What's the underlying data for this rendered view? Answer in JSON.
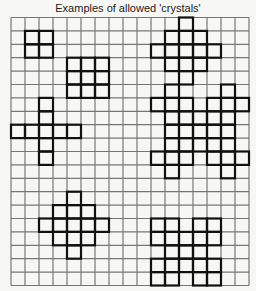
{
  "title": "Examples of allowed  'crystals'",
  "grid": {
    "columns": 17,
    "rows": 20,
    "line_color": "#777777",
    "crystal_color": "#111111"
  },
  "crystals": [
    {
      "name": "square-2x2",
      "cells": [
        [
          1,
          1
        ],
        [
          1,
          2
        ],
        [
          2,
          1
        ],
        [
          2,
          2
        ]
      ]
    },
    {
      "name": "diamond-top-right",
      "cells": [
        [
          0,
          12
        ],
        [
          1,
          11
        ],
        [
          1,
          12
        ],
        [
          1,
          13
        ],
        [
          2,
          10
        ],
        [
          2,
          11
        ],
        [
          2,
          12
        ],
        [
          2,
          13
        ],
        [
          2,
          14
        ],
        [
          3,
          11
        ],
        [
          3,
          12
        ],
        [
          3,
          13
        ],
        [
          4,
          12
        ]
      ]
    },
    {
      "name": "square-3x3",
      "cells": [
        [
          3,
          4
        ],
        [
          3,
          5
        ],
        [
          3,
          6
        ],
        [
          4,
          4
        ],
        [
          4,
          5
        ],
        [
          4,
          6
        ],
        [
          5,
          4
        ],
        [
          5,
          5
        ],
        [
          5,
          6
        ]
      ]
    },
    {
      "name": "cross",
      "cells": [
        [
          6,
          2
        ],
        [
          7,
          2
        ],
        [
          8,
          0
        ],
        [
          8,
          1
        ],
        [
          8,
          2
        ],
        [
          8,
          3
        ],
        [
          8,
          4
        ],
        [
          9,
          2
        ],
        [
          10,
          2
        ]
      ]
    },
    {
      "name": "double-cluster",
      "cells": [
        [
          5,
          11
        ],
        [
          5,
          15
        ],
        [
          6,
          10
        ],
        [
          6,
          11
        ],
        [
          6,
          12
        ],
        [
          6,
          14
        ],
        [
          6,
          15
        ],
        [
          6,
          16
        ],
        [
          7,
          11
        ],
        [
          7,
          12
        ],
        [
          7,
          13
        ],
        [
          7,
          14
        ],
        [
          7,
          15
        ],
        [
          8,
          11
        ],
        [
          8,
          12
        ],
        [
          8,
          13
        ],
        [
          8,
          14
        ],
        [
          8,
          15
        ],
        [
          9,
          11
        ],
        [
          9,
          12
        ],
        [
          9,
          13
        ],
        [
          9,
          14
        ],
        [
          9,
          15
        ],
        [
          10,
          10
        ],
        [
          10,
          11
        ],
        [
          10,
          12
        ],
        [
          10,
          14
        ],
        [
          10,
          15
        ],
        [
          10,
          16
        ],
        [
          11,
          11
        ],
        [
          11,
          15
        ]
      ]
    },
    {
      "name": "diamond-bottom-left",
      "cells": [
        [
          13,
          4
        ],
        [
          14,
          3
        ],
        [
          14,
          4
        ],
        [
          14,
          5
        ],
        [
          15,
          2
        ],
        [
          15,
          3
        ],
        [
          15,
          4
        ],
        [
          15,
          5
        ],
        [
          15,
          6
        ],
        [
          16,
          3
        ],
        [
          16,
          4
        ],
        [
          16,
          5
        ],
        [
          17,
          4
        ]
      ]
    },
    {
      "name": "lattice-bottom-right",
      "cells": [
        [
          15,
          10
        ],
        [
          15,
          11
        ],
        [
          15,
          13
        ],
        [
          15,
          14
        ],
        [
          16,
          10
        ],
        [
          16,
          11
        ],
        [
          16,
          12
        ],
        [
          16,
          13
        ],
        [
          16,
          14
        ],
        [
          17,
          11
        ],
        [
          17,
          12
        ],
        [
          17,
          13
        ],
        [
          18,
          10
        ],
        [
          18,
          11
        ],
        [
          18,
          12
        ],
        [
          18,
          13
        ],
        [
          18,
          14
        ],
        [
          19,
          10
        ],
        [
          19,
          11
        ],
        [
          19,
          13
        ],
        [
          19,
          14
        ]
      ]
    }
  ]
}
